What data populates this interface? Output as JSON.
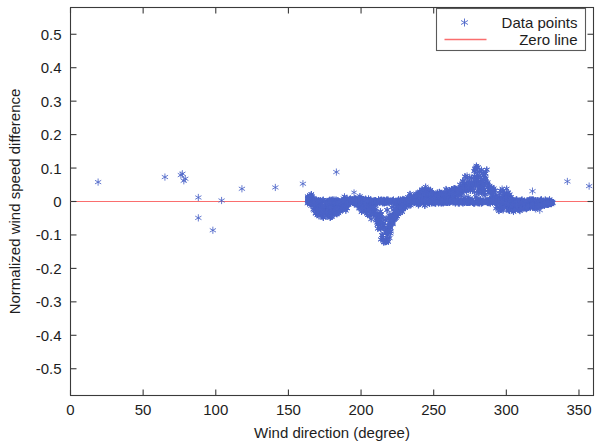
{
  "figure": {
    "background_color": "#ffffff",
    "axes_color": "#3a3a3a"
  },
  "legend": {
    "position": "top-right",
    "entries": [
      {
        "label": "Data points",
        "marker": "asterisk-marker",
        "color": "#4a63c8"
      },
      {
        "label": "Zero line",
        "marker": "line",
        "color": "#fa6e6e"
      }
    ]
  },
  "axis": {
    "x_title": "Wind direction (degree)",
    "y_title": "Normalized wind speed difference",
    "x_ticks": [
      "0",
      "50",
      "100",
      "150",
      "200",
      "250",
      "300",
      "350"
    ],
    "y_ticks": [
      "0.5",
      "0.4",
      "0.3",
      "0.2",
      "0.1",
      "0",
      "-0.1",
      "-0.2",
      "-0.3",
      "-0.4",
      "-0.5"
    ]
  },
  "chart_data": {
    "type": "scatter",
    "title": "",
    "xlabel": "Wind direction (degree)",
    "ylabel": "Normalized wind speed difference",
    "xlim": [
      0,
      360
    ],
    "ylim": [
      -0.58,
      0.58
    ],
    "xticks": [
      0,
      50,
      100,
      150,
      200,
      250,
      300,
      350
    ],
    "yticks": [
      -0.5,
      -0.4,
      -0.3,
      -0.2,
      -0.1,
      0,
      0.1,
      0.2,
      0.3,
      0.4,
      0.5
    ],
    "grid": false,
    "legend_position": "top-right",
    "marker": "asterisk",
    "marker_color": "#4a63c8",
    "reference_line": {
      "name": "Zero line",
      "y": 0,
      "color": "#fa6e6e"
    },
    "series": [
      {
        "name": "Data points",
        "color": "#4a63c8",
        "sparse_points": [
          [
            19,
            0.058
          ],
          [
            65,
            0.073
          ],
          [
            76,
            0.079
          ],
          [
            77,
            0.083
          ],
          [
            78,
            0.062
          ],
          [
            79,
            0.068
          ],
          [
            88,
            0.012
          ],
          [
            88,
            -0.049
          ],
          [
            98,
            -0.086
          ],
          [
            104,
            0.003
          ],
          [
            118,
            0.038
          ],
          [
            141,
            0.042
          ],
          [
            160,
            0.053
          ],
          [
            183,
            0.088
          ],
          [
            318,
            0.031
          ],
          [
            320,
            -0.022
          ],
          [
            323,
            -0.026
          ],
          [
            324,
            0.005
          ],
          [
            342,
            0.06
          ],
          [
            357,
            0.046
          ]
        ],
        "dense_band": {
          "x_start": 163,
          "x_end": 332,
          "description": "Dense cloud of points concentrated near zero with structured envelope",
          "envelope": [
            {
              "x": 163,
              "y_low": -0.004,
              "y_high": 0.03
            },
            {
              "x": 166,
              "y_low": -0.03,
              "y_high": 0.04
            },
            {
              "x": 170,
              "y_low": -0.058,
              "y_high": 0.018
            },
            {
              "x": 175,
              "y_low": -0.066,
              "y_high": 0.01
            },
            {
              "x": 180,
              "y_low": -0.062,
              "y_high": 0.012
            },
            {
              "x": 185,
              "y_low": -0.055,
              "y_high": 0.018
            },
            {
              "x": 190,
              "y_low": -0.042,
              "y_high": 0.03
            },
            {
              "x": 195,
              "y_low": -0.038,
              "y_high": 0.038
            },
            {
              "x": 200,
              "y_low": -0.04,
              "y_high": 0.034
            },
            {
              "x": 205,
              "y_low": -0.055,
              "y_high": 0.02
            },
            {
              "x": 210,
              "y_low": -0.08,
              "y_high": 0.012
            },
            {
              "x": 213,
              "y_low": -0.13,
              "y_high": 0.008
            },
            {
              "x": 215,
              "y_low": -0.175,
              "y_high": 0.006
            },
            {
              "x": 217,
              "y_low": -0.19,
              "y_high": 0.006
            },
            {
              "x": 219,
              "y_low": -0.186,
              "y_high": 0.008
            },
            {
              "x": 221,
              "y_low": -0.12,
              "y_high": 0.01
            },
            {
              "x": 224,
              "y_low": -0.07,
              "y_high": 0.012
            },
            {
              "x": 228,
              "y_low": -0.04,
              "y_high": 0.016
            },
            {
              "x": 232,
              "y_low": -0.028,
              "y_high": 0.024
            },
            {
              "x": 238,
              "y_low": -0.024,
              "y_high": 0.04
            },
            {
              "x": 244,
              "y_low": -0.02,
              "y_high": 0.058
            },
            {
              "x": 250,
              "y_low": -0.018,
              "y_high": 0.048
            },
            {
              "x": 256,
              "y_low": -0.016,
              "y_high": 0.044
            },
            {
              "x": 262,
              "y_low": -0.014,
              "y_high": 0.052
            },
            {
              "x": 268,
              "y_low": -0.012,
              "y_high": 0.08
            },
            {
              "x": 272,
              "y_low": -0.01,
              "y_high": 0.1
            },
            {
              "x": 276,
              "y_low": -0.012,
              "y_high": 0.122
            },
            {
              "x": 280,
              "y_low": -0.014,
              "y_high": 0.148
            },
            {
              "x": 284,
              "y_low": -0.018,
              "y_high": 0.135
            },
            {
              "x": 287,
              "y_low": -0.022,
              "y_high": 0.14
            },
            {
              "x": 290,
              "y_low": -0.036,
              "y_high": 0.07
            },
            {
              "x": 295,
              "y_low": -0.046,
              "y_high": 0.05
            },
            {
              "x": 300,
              "y_low": -0.058,
              "y_high": 0.068
            },
            {
              "x": 305,
              "y_low": -0.04,
              "y_high": 0.01
            },
            {
              "x": 310,
              "y_low": -0.032,
              "y_high": 0.004
            },
            {
              "x": 316,
              "y_low": -0.03,
              "y_high": 0.002
            },
            {
              "x": 325,
              "y_low": -0.022,
              "y_high": 0.004
            },
            {
              "x": 332,
              "y_low": -0.01,
              "y_high": 0.002
            }
          ]
        }
      }
    ]
  }
}
